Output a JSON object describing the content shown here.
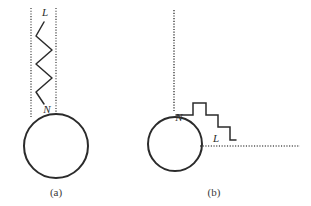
{
  "figure": {
    "type": "diagram",
    "background_color": "#ffffff",
    "stroke_color": "#2b2b2b",
    "dotted_color": "#555555",
    "panels": [
      {
        "id": "a",
        "caption": "(a)",
        "caption_x": 56,
        "caption_y": 196,
        "circle": {
          "cx": 56,
          "cy": 146,
          "r": 32
        },
        "labels": [
          {
            "text": "L",
            "x": 45,
            "y": 16
          },
          {
            "text": "N",
            "x": 47,
            "y": 113
          }
        ],
        "dotted_lines": [
          {
            "x1": 31,
            "y1": 8,
            "x2": 31,
            "y2": 118
          },
          {
            "x1": 56,
            "y1": 8,
            "x2": 56,
            "y2": 114
          }
        ],
        "zigzag": {
          "orientation": "vertical",
          "points": "44,22 36,36 52,50 36,64 52,78 36,92 44,104"
        }
      },
      {
        "id": "b",
        "caption": "(b)",
        "caption_x": 214,
        "caption_y": 196,
        "circle": {
          "cx": 175,
          "cy": 144,
          "r": 27
        },
        "labels": [
          {
            "text": "N",
            "x": 179,
            "y": 121
          },
          {
            "text": "L",
            "x": 216,
            "y": 142
          }
        ],
        "dotted_lines": [
          {
            "x1": 174,
            "y1": 10,
            "x2": 174,
            "y2": 112
          },
          {
            "x1": 200,
            "y1": 146,
            "x2": 300,
            "y2": 146
          }
        ],
        "zigzag": {
          "orientation": "staircase",
          "points": "176,115 193,115 193,103 206,103 206,115 218,115 218,127 230,127 230,140 236,140"
        }
      }
    ]
  }
}
